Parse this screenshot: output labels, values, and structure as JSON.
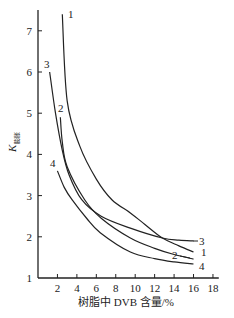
{
  "chart_data": {
    "type": "line",
    "title": "",
    "xlabel": "树脂中 DVB 含量/%",
    "ylabel": "K",
    "ylabel_subscript": "膨胀",
    "xlim": [
      0,
      18
    ],
    "ylim": [
      1,
      7.4
    ],
    "xticks": [
      2,
      4,
      6,
      8,
      10,
      12,
      14,
      16,
      18
    ],
    "yticks": [
      1,
      2,
      3,
      4,
      5,
      6,
      7
    ],
    "grid": false,
    "legend": "inline curve labels",
    "series": [
      {
        "name": "1",
        "x": [
          2.5,
          3.0,
          4.3,
          6.0,
          7.6,
          9.5,
          11.0,
          12.8,
          14.5,
          16.0
        ],
        "y": [
          7.4,
          5.3,
          4.2,
          3.4,
          2.9,
          2.58,
          2.3,
          1.97,
          1.78,
          1.63
        ]
      },
      {
        "name": "2",
        "x": [
          2.3,
          2.5,
          3.0,
          4.8,
          6.5,
          9.5,
          12.0,
          14.0,
          16.0
        ],
        "y": [
          4.9,
          4.3,
          3.7,
          2.9,
          2.45,
          1.97,
          1.72,
          1.57,
          1.46
        ]
      },
      {
        "name": "3",
        "x": [
          1.2,
          1.8,
          2.5,
          3.2,
          4.5,
          6.5,
          9.5,
          12.8,
          14.5,
          16.0
        ],
        "y": [
          6.0,
          5.0,
          4.1,
          3.5,
          2.9,
          2.5,
          2.21,
          1.97,
          1.92,
          1.9
        ]
      },
      {
        "name": "4",
        "x": [
          2.0,
          2.7,
          3.5,
          5.0,
          6.4,
          9.5,
          12.0,
          14.0,
          16.0
        ],
        "y": [
          3.6,
          3.2,
          2.9,
          2.45,
          2.1,
          1.63,
          1.47,
          1.39,
          1.34
        ]
      }
    ]
  },
  "labels": {
    "xlabel": "树脂中 DVB 含量/%",
    "ylabel_main": "K",
    "ylabel_sub": "膨胀"
  }
}
